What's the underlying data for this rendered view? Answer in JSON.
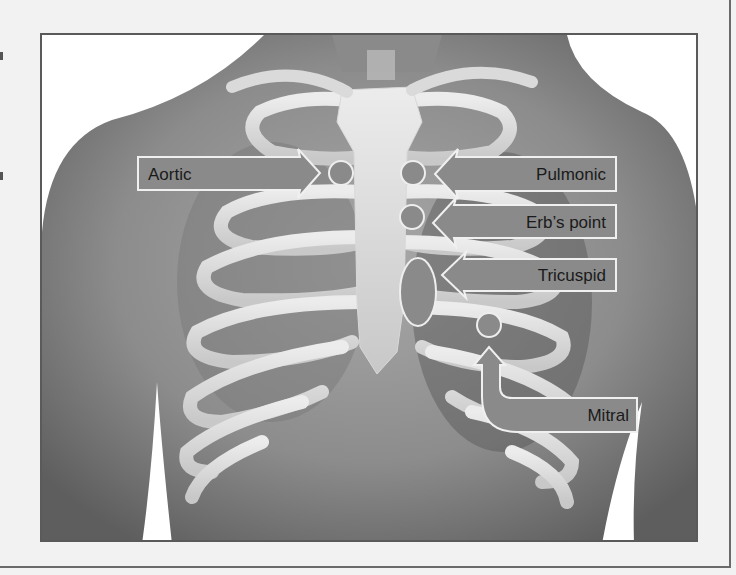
{
  "figure": {
    "labels": {
      "aortic": "Aortic",
      "pulmonic": "Pulmonic",
      "erbs_point": "Erb’s point",
      "tricuspid": "Tricuspid",
      "mitral": "Mitral"
    },
    "colors": {
      "arrow_fill": "#8a8a8a",
      "arrow_stroke": "#f0f0f0",
      "skin_dark": "#6e6e6e",
      "skin_light": "#b4b4b4",
      "bone": "#e2e2e2",
      "page_bg": "#f2f2f2"
    }
  }
}
